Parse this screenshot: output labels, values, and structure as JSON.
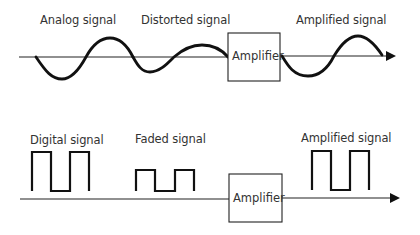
{
  "analog_row": {
    "labels": {
      "input": "Analog signal",
      "distorted": "Distorted signal",
      "output": "Amplified signal"
    },
    "amplifier_label": "Amplifier"
  },
  "digital_row": {
    "labels": {
      "input": "Digital signal",
      "faded": "Faded signal",
      "output": "Amplified signal"
    },
    "amplifier_label": "Amplifier"
  },
  "colors": {
    "stroke": "#111111",
    "text": "#333333",
    "background": "#ffffff"
  }
}
